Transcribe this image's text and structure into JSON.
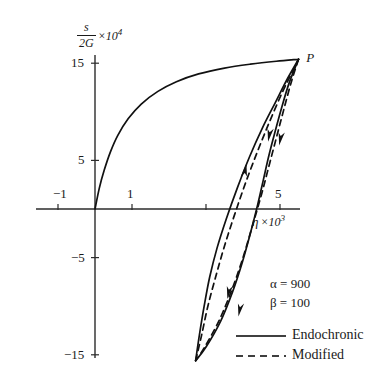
{
  "chart_data": {
    "type": "line",
    "title": "",
    "xlabel": "η × 10³",
    "ylabel": "s/2G × 10⁴",
    "ylabel_numerator": "s",
    "ylabel_denominator": "2G",
    "ylabel_factor_base": "10",
    "ylabel_factor_exp": "4",
    "xlabel_symbol": "η",
    "xlabel_factor_base": "10",
    "xlabel_factor_exp": "3",
    "xlim": [
      -1.6,
      7.2
    ],
    "ylim": [
      -17.5,
      17.5
    ],
    "grid": false,
    "legend_position": "lower-right",
    "xticks": [
      -1,
      1,
      3,
      5
    ],
    "xtick_labels": [
      "−1",
      "1",
      "",
      "5"
    ],
    "yticks": [
      15,
      5,
      -5,
      -15
    ],
    "ytick_labels": [
      "15",
      "5",
      "−5",
      "−15"
    ],
    "annotations": [
      {
        "text": "P",
        "x": 5.55,
        "y": 15.6,
        "name": "point-p-label"
      }
    ],
    "parameters": [
      {
        "symbol": "α",
        "value": "900",
        "text": "α = 900"
      },
      {
        "symbol": "β",
        "value": "100",
        "text": "β = 100"
      }
    ],
    "legend": [
      {
        "label": "Endochronic",
        "style": "solid",
        "color": "#000000"
      },
      {
        "label": "Modified",
        "style": "dashed",
        "color": "#000000"
      }
    ],
    "series": [
      {
        "name": "virgin-loading-endochronic",
        "style": "solid",
        "points": [
          [
            0,
            0
          ],
          [
            0.12,
            2.2
          ],
          [
            0.25,
            4.0
          ],
          [
            0.42,
            5.9
          ],
          [
            0.62,
            7.6
          ],
          [
            0.9,
            9.3
          ],
          [
            1.25,
            10.8
          ],
          [
            1.7,
            12.1
          ],
          [
            2.2,
            13.1
          ],
          [
            2.8,
            13.9
          ],
          [
            3.5,
            14.5
          ],
          [
            4.2,
            14.9
          ],
          [
            4.9,
            15.2
          ],
          [
            5.5,
            15.4
          ]
        ]
      },
      {
        "name": "unload-branch-endochronic",
        "style": "solid",
        "points": [
          [
            5.5,
            15.4
          ],
          [
            5.25,
            13.0
          ],
          [
            5.05,
            10.5
          ],
          [
            4.87,
            8.0
          ],
          [
            4.7,
            5.5
          ],
          [
            4.55,
            3.0
          ],
          [
            4.4,
            0.5
          ],
          [
            4.2,
            -2.5
          ],
          [
            3.98,
            -5.5
          ],
          [
            3.72,
            -8.5
          ],
          [
            3.4,
            -11.5
          ],
          [
            3.0,
            -14.2
          ],
          [
            2.72,
            -15.6
          ]
        ]
      },
      {
        "name": "reload-branch-endochronic",
        "style": "solid",
        "points": [
          [
            2.72,
            -15.6
          ],
          [
            2.82,
            -13.0
          ],
          [
            2.95,
            -10.0
          ],
          [
            3.1,
            -7.0
          ],
          [
            3.3,
            -4.0
          ],
          [
            3.55,
            -1.0
          ],
          [
            3.85,
            2.2
          ],
          [
            4.18,
            5.4
          ],
          [
            4.52,
            8.3
          ],
          [
            4.88,
            11.0
          ],
          [
            5.2,
            13.4
          ],
          [
            5.5,
            15.4
          ]
        ]
      },
      {
        "name": "unload-branch-modified",
        "style": "dashed",
        "points": [
          [
            5.5,
            15.4
          ],
          [
            5.3,
            13.0
          ],
          [
            5.1,
            10.2
          ],
          [
            4.9,
            7.3
          ],
          [
            4.7,
            4.4
          ],
          [
            4.5,
            1.5
          ],
          [
            4.25,
            -1.8
          ],
          [
            4.0,
            -5.0
          ],
          [
            3.7,
            -8.3
          ],
          [
            3.35,
            -11.5
          ],
          [
            2.95,
            -14.3
          ],
          [
            2.72,
            -15.6
          ]
        ]
      },
      {
        "name": "reload-branch-modified",
        "style": "dashed",
        "points": [
          [
            2.72,
            -15.6
          ],
          [
            2.88,
            -13.0
          ],
          [
            3.05,
            -10.0
          ],
          [
            3.26,
            -7.0
          ],
          [
            3.5,
            -3.8
          ],
          [
            3.78,
            -0.5
          ],
          [
            4.08,
            2.8
          ],
          [
            4.4,
            6.0
          ],
          [
            4.72,
            9.0
          ],
          [
            5.05,
            11.9
          ],
          [
            5.32,
            14.0
          ],
          [
            5.5,
            15.4
          ]
        ]
      }
    ],
    "arrows": [
      {
        "name": "arrow-reload-up",
        "x": 4.05,
        "y": 4.0,
        "direction": "up"
      },
      {
        "name": "arrow-unload-dashed-down",
        "x": 4.72,
        "y": 7.6,
        "direction": "down"
      },
      {
        "name": "arrow-unload-solid-down",
        "x": 5.02,
        "y": 7.2,
        "direction": "down"
      },
      {
        "name": "arrow-unload-dashed-lower-down",
        "x": 3.62,
        "y": -8.6,
        "direction": "down"
      },
      {
        "name": "arrow-unload-solid-lower-down",
        "x": 3.92,
        "y": -10.4,
        "direction": "down"
      }
    ]
  }
}
